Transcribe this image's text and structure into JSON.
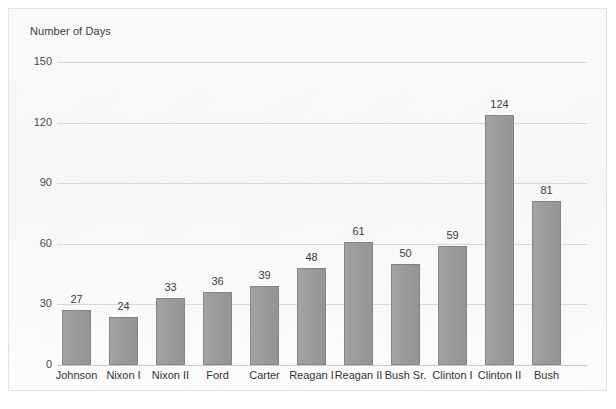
{
  "chart_data": {
    "type": "bar",
    "title": "Number of Days",
    "xlabel": "",
    "ylabel": "Number of Days",
    "ylim": [
      0,
      150
    ],
    "yticks": [
      0,
      30,
      60,
      90,
      120,
      150
    ],
    "grid": true,
    "legend": "none",
    "bar_color": "#9a9a9a",
    "bar_border_color": "#848484",
    "categories": [
      "Johnson",
      "Nixon I",
      "Nixon II",
      "Ford",
      "Carter",
      "Reagan I",
      "Reagan II",
      "Bush Sr.",
      "Clinton I",
      "Clinton II",
      "Bush"
    ],
    "values": [
      27,
      24,
      33,
      36,
      39,
      48,
      61,
      50,
      59,
      124,
      81
    ],
    "value_labels": [
      "27",
      "24",
      "33",
      "36",
      "39",
      "48",
      "61",
      "50",
      "59",
      "124",
      "81"
    ],
    "ytick_labels": [
      "0",
      "30",
      "60",
      "90",
      "120",
      "150"
    ]
  }
}
